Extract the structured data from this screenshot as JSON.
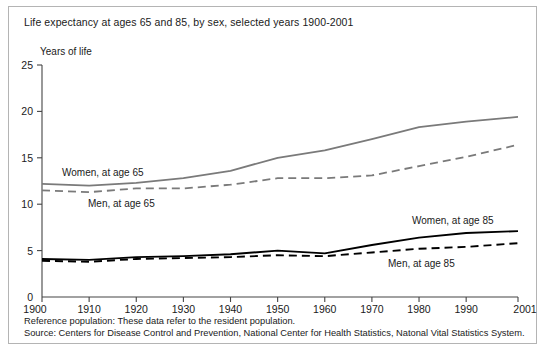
{
  "figure": {
    "title": "Life expectancy at ages 65 and 85, by sex, selected years 1900-2001",
    "y_axis_title": "Years of life",
    "footnote_reference": "Reference population: These data refer to the resident population.",
    "footnote_source": "Source: Centers for Disease Control and Prevention, National Center for Health Statistics, Natonal Vital Statistics System.",
    "colors": {
      "age65_series": "#7a7a7a",
      "age85_series": "#000000",
      "axis": "#444444",
      "frame_border": "#b4b4b4",
      "background": "#ffffff",
      "text": "#1a1a1a"
    }
  },
  "annotations": {
    "women_65": "Women, at age 65",
    "men_65": "Men, at age 65",
    "women_85": "Women, at age 85",
    "men_85": "Men, at age 85"
  },
  "chart_data": {
    "type": "line",
    "title": "Life expectancy at ages 65 and 85, by sex, selected years 1900-2001",
    "xlabel": "",
    "ylabel": "Years of life",
    "xlim": [
      1900,
      2001
    ],
    "ylim": [
      0,
      25
    ],
    "yticks": [
      0,
      5,
      10,
      15,
      20,
      25
    ],
    "xticks": [
      1900,
      1910,
      1920,
      1930,
      1940,
      1950,
      1960,
      1970,
      1980,
      1990,
      2001
    ],
    "xtick_labels": [
      "1900",
      "1910",
      "1920",
      "1930",
      "1940",
      "1950",
      "1960",
      "1970",
      "1980",
      "1990",
      "2001"
    ],
    "grid": false,
    "legend": "inline-annotations",
    "x": [
      1900,
      1910,
      1920,
      1930,
      1940,
      1950,
      1960,
      1970,
      1980,
      1990,
      2001
    ],
    "series": [
      {
        "name": "Women, at age 65",
        "style": "solid",
        "color": "#7a7a7a",
        "values": [
          12.2,
          12.0,
          12.3,
          12.8,
          13.6,
          15.0,
          15.8,
          17.0,
          18.3,
          18.9,
          19.4
        ]
      },
      {
        "name": "Men, at age 65",
        "style": "dashed",
        "color": "#7a7a7a",
        "values": [
          11.5,
          11.3,
          11.7,
          11.7,
          12.1,
          12.8,
          12.8,
          13.1,
          14.1,
          15.1,
          16.4
        ]
      },
      {
        "name": "Women, at age 85",
        "style": "solid",
        "color": "#000000",
        "values": [
          4.1,
          4.0,
          4.3,
          4.4,
          4.6,
          5.0,
          4.7,
          5.6,
          6.4,
          6.9,
          7.1
        ]
      },
      {
        "name": "Men, at age 85",
        "style": "dashed",
        "color": "#000000",
        "values": [
          3.9,
          3.8,
          4.1,
          4.2,
          4.3,
          4.5,
          4.4,
          4.8,
          5.2,
          5.4,
          5.8
        ]
      }
    ]
  }
}
